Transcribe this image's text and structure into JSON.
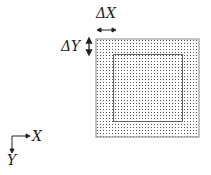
{
  "labels": {
    "delta_x": "ΔX",
    "delta_y": "ΔY",
    "axis_x": "X",
    "axis_y": "Y"
  },
  "grid": {
    "outer": {
      "x": 96,
      "y": 39,
      "w": 103,
      "h": 98
    },
    "inner": {
      "x": 113,
      "y": 54,
      "w": 69,
      "h": 67
    },
    "dot_spacing": 3,
    "border_color": "#9a9a9a",
    "dot_color": "#555555",
    "inner_color": "#666666"
  }
}
